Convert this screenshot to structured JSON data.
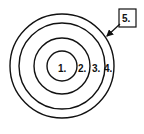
{
  "diagram": {
    "type": "concentric-circles",
    "center": [
      62,
      66
    ],
    "rings": [
      {
        "id": 1,
        "label": "1.",
        "radius": 15
      },
      {
        "id": 2,
        "label": "2.",
        "radius": 28
      },
      {
        "id": 3,
        "label": "3.",
        "radius": 43
      },
      {
        "id": 4,
        "label": "4.",
        "radius": 52
      }
    ],
    "callout": {
      "label": "5.",
      "points_to": "outer-ring-edge"
    },
    "stroke_color": "#111111",
    "background": "#ffffff"
  }
}
